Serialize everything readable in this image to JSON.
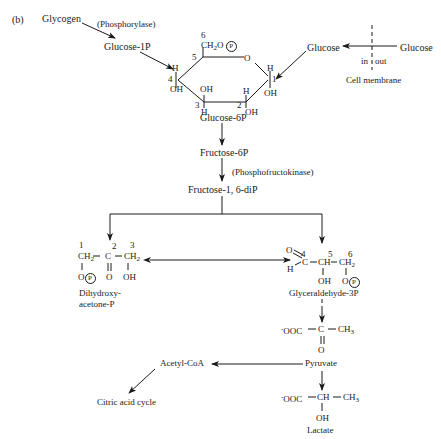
{
  "figure_label": "(b)",
  "nodes": {
    "glycogen": "Glycogen",
    "phosphorylase": "(Phosphorylase)",
    "glucose_1p": "Glucose-1P",
    "glucose_in": "Glucose",
    "glucose_out": "Glucose",
    "in_label": "in",
    "out_label": "out",
    "cell_membrane": "Cell membrane",
    "glucose_6p": "Glucose-6P",
    "fructose_6p": "Fructose-6P",
    "phosphofructokinase": "(Phosphofructokinase)",
    "fructose_16dip": "Fructose-1, 6-diP",
    "dhap_line1": "Dihydroxy-",
    "dhap_line2": "acetone-P",
    "g3p": "Glyceraldehyde-3P",
    "pyruvate": "Pyruvate",
    "lactate": "Lactate",
    "acetyl_coa": "Acetyl-CoA",
    "citric_acid_cycle": "Citric acid cycle"
  },
  "glucose_ring": {
    "c6": "6",
    "ch2o": "CH",
    "two": "2",
    "o": "O",
    "p": "P",
    "c5": "5",
    "ring_o": "O",
    "c4": "4",
    "h4": "H",
    "oh4": "OH",
    "c3": "3",
    "oh3": "OH",
    "h3": "H",
    "c2": "2",
    "h2": "H",
    "oh2": "OH",
    "c1": "1",
    "h1": "H",
    "oh1": "OH"
  },
  "dhap": {
    "n1": "1",
    "n2": "2",
    "n3": "3",
    "ch2a": "CH",
    "c": "C",
    "ch2b": "CH",
    "o1": "O",
    "p": "P",
    "o2": "O",
    "oh": "OH",
    "sub2": "2"
  },
  "g3p_struct": {
    "n4": "4",
    "n5": "5",
    "n6": "6",
    "o": "O",
    "h": "H",
    "c": "C",
    "ch": "CH",
    "ch2": "CH",
    "sub2": "2",
    "oh": "OH",
    "o2": "O",
    "p": "P"
  },
  "pyruvate_struct": {
    "ooc": "OOC",
    "minus": "-",
    "c": "C",
    "ch3": "CH",
    "sub3": "3",
    "o": "O"
  },
  "lactate_struct": {
    "ooc": "OOC",
    "minus": "-",
    "ch": "CH",
    "ch3": "CH",
    "sub3": "3",
    "oh": "OH"
  },
  "colors": {
    "ink": "#1a1a1a",
    "background": "#ffffff"
  }
}
